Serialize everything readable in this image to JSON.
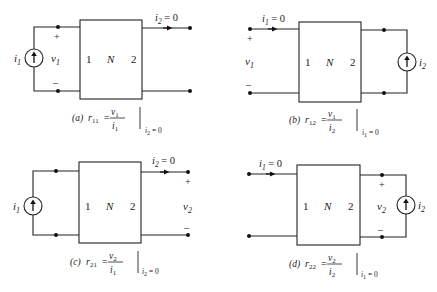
{
  "figure": {
    "panels": [
      {
        "id": "a",
        "network_label": "N",
        "port1_label": "1",
        "port2_label": "2",
        "source_label": "i",
        "source_sub": "1",
        "voltage_label": "v",
        "voltage_sub": "1",
        "plus": "+",
        "minus": "–",
        "current_label": "i",
        "current_sub": "2",
        "current_eq": " = 0",
        "caption": {
          "tag": "(a)",
          "param": "r",
          "param_sub": "11",
          "eq": "=",
          "num": "v",
          "num_sub": "1",
          "den": "i",
          "den_sub": "1",
          "cond": "i",
          "cond_sub": "2",
          "cond_eq": " = 0"
        }
      },
      {
        "id": "b",
        "network_label": "N",
        "port1_label": "1",
        "port2_label": "2",
        "source_label": "i",
        "source_sub": "2",
        "voltage_label": "v",
        "voltage_sub": "1",
        "plus": "+",
        "minus": "–",
        "current_label": "i",
        "current_sub": "1",
        "current_eq": " = 0",
        "caption": {
          "tag": "(b)",
          "param": "r",
          "param_sub": "12",
          "eq": "=",
          "num": "v",
          "num_sub": "1",
          "den": "i",
          "den_sub": "2",
          "cond": "i",
          "cond_sub": "1",
          "cond_eq": " = 0"
        }
      },
      {
        "id": "c",
        "network_label": "N",
        "port1_label": "1",
        "port2_label": "2",
        "source_label": "i",
        "source_sub": "1",
        "voltage_label": "v",
        "voltage_sub": "2",
        "plus": "+",
        "minus": "–",
        "current_label": "i",
        "current_sub": "2",
        "current_eq": " = 0",
        "caption": {
          "tag": "(c)",
          "param": "r",
          "param_sub": "21",
          "eq": "=",
          "num": "v",
          "num_sub": "2",
          "den": "i",
          "den_sub": "1",
          "cond": "i",
          "cond_sub": "2",
          "cond_eq": " = 0"
        }
      },
      {
        "id": "d",
        "network_label": "N",
        "port1_label": "1",
        "port2_label": "2",
        "source_label": "i",
        "source_sub": "2",
        "voltage_label": "v",
        "voltage_sub": "2",
        "plus": "+",
        "minus": "–",
        "current_label": "i",
        "current_sub": "1",
        "current_eq": " = 0",
        "caption": {
          "tag": "(d)",
          "param": "r",
          "param_sub": "22",
          "eq": "=",
          "num": "v",
          "num_sub": "2",
          "den": "i",
          "den_sub": "2",
          "cond": "i",
          "cond_sub": "1",
          "cond_eq": " = 0"
        }
      }
    ]
  }
}
